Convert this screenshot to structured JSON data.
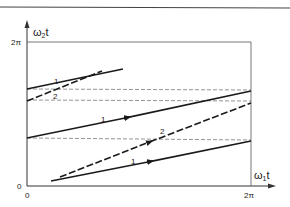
{
  "diagram": {
    "y_axis_label": "ω₂t",
    "y_axis_label_base": "ω",
    "y_axis_label_sub": "2",
    "y_axis_label_tail": "t",
    "x_axis_label_base": "ω",
    "x_axis_label_sub": "1",
    "x_axis_label_tail": "t",
    "y_top_tick": "2π",
    "y_zero_tick": "0",
    "x_zero_tick": "0",
    "x_right_tick": "2π",
    "trajectory_labels": {
      "upper_1": "1",
      "upper_2": "2",
      "middle_1": "1",
      "lower_2": "2",
      "lower_1": "1"
    },
    "colors": {
      "line": "#1a1a1a",
      "dashed_guide": "#777777",
      "frame": "#555555"
    }
  }
}
